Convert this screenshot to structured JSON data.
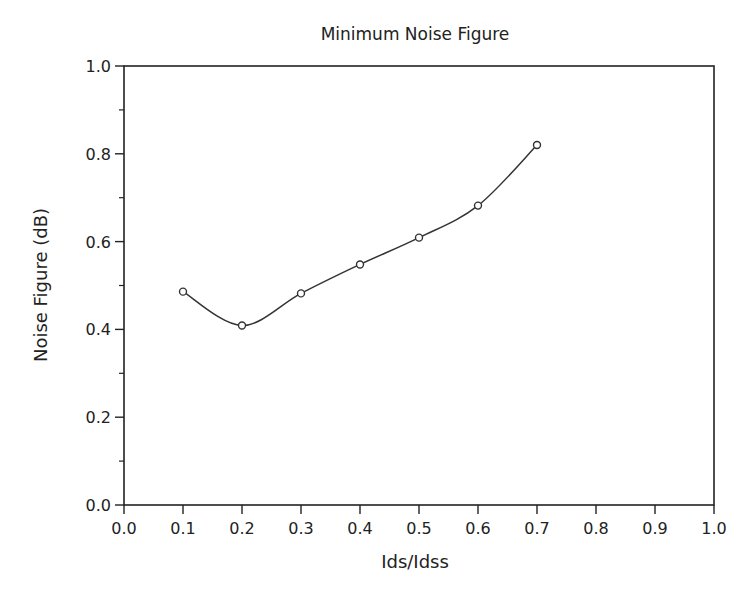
{
  "chart_data": {
    "type": "line",
    "title": "Minimum Noise Figure",
    "xlabel": "Ids/Idss",
    "ylabel": "Noise Figure (dB)",
    "xlim": [
      0.0,
      1.0
    ],
    "ylim": [
      0.0,
      1.0
    ],
    "x_ticks": [
      "0.0",
      "0.1",
      "0.2",
      "0.3",
      "0.4",
      "0.5",
      "0.6",
      "0.7",
      "0.8",
      "0.9",
      "1.0"
    ],
    "y_ticks": [
      "0.0",
      "0.2",
      "0.4",
      "0.6",
      "0.8",
      "1.0"
    ],
    "y_minor_ticks": [
      0.1,
      0.3,
      0.5,
      0.7,
      0.9
    ],
    "grid": false,
    "legend": null,
    "series": [
      {
        "name": "Minimum Noise Figure",
        "marker": "circle",
        "line": "smooth",
        "x": [
          0.1,
          0.2,
          0.3,
          0.4,
          0.5,
          0.6,
          0.7
        ],
        "values": [
          0.486,
          0.409,
          0.482,
          0.548,
          0.609,
          0.682,
          0.82
        ]
      }
    ]
  },
  "colors": {
    "axis": "#222222",
    "line": "#333333",
    "background": "#ffffff"
  }
}
